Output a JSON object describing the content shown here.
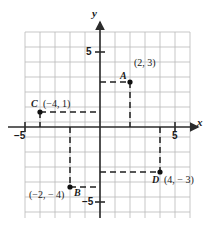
{
  "figure": {
    "kind": "coordinate-plane",
    "background_color": "#ffffff",
    "grid_color": "#b9b9b9",
    "axis_color": "#2b2b2b",
    "dash_color": "#1f1f1f",
    "point_color": "#111111"
  },
  "axes": {
    "x_label": "x",
    "y_label": "y",
    "x_ticks": [
      {
        "value": -5,
        "label": "−5"
      },
      {
        "value": 5,
        "label": "5"
      }
    ],
    "y_ticks": [
      {
        "value": 5,
        "label": "5"
      },
      {
        "value": -5,
        "label": "−5"
      }
    ],
    "x_range": [
      -5,
      6
    ],
    "y_range": [
      -6,
      6
    ]
  },
  "points": [
    {
      "name": "A",
      "label": "A",
      "coord_label": "(2, 3)",
      "x": 2,
      "y": 3
    },
    {
      "name": "B",
      "label": "B",
      "coord_label": "(−2, − 4)",
      "x": -2,
      "y": -4
    },
    {
      "name": "C",
      "label": "C",
      "coord_label": "(−4, 1)",
      "x": -4,
      "y": 1
    },
    {
      "name": "D",
      "label": "D",
      "coord_label": "(4, − 3)",
      "x": 4,
      "y": -3
    }
  ]
}
